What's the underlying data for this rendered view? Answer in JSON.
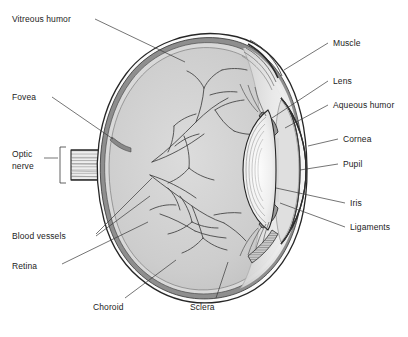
{
  "diagram": {
    "type": "anatomical-cross-section",
    "background_color": "#ffffff",
    "text_color": "#1c1c1c",
    "leader_line_color": "#3a3a3a"
  },
  "labels": {
    "vitreous_humor": "Vitreous humor",
    "fovea": "Fovea",
    "optic_nerve_line1": "Optic",
    "optic_nerve_line2": "nerve",
    "blood_vessels": "Blood vessels",
    "retina": "Retina",
    "choroid": "Choroid",
    "sclera": "Sclera",
    "muscle": "Muscle",
    "lens": "Lens",
    "aqueous_humor": "Aqueous humor",
    "cornea": "Cornea",
    "pupil": "Pupil",
    "iris": "Iris",
    "ligaments": "Ligaments"
  },
  "structures": {
    "sclera_fill": "#fbfbfb",
    "choroid_fill": "#8e8e8e",
    "retina_fill": "#d6d6d6",
    "vitreous_fill": "#cfcfcf",
    "aqueous_fill": "#dcdcdc",
    "lens_fill": "#f4f4f4",
    "cornea_fill": "#ededed",
    "iris_fill": "#9a9a9a",
    "nerve_fill": "#e4e4e4",
    "muscle_fill": "#b5b5b5",
    "outline": "#262626"
  }
}
